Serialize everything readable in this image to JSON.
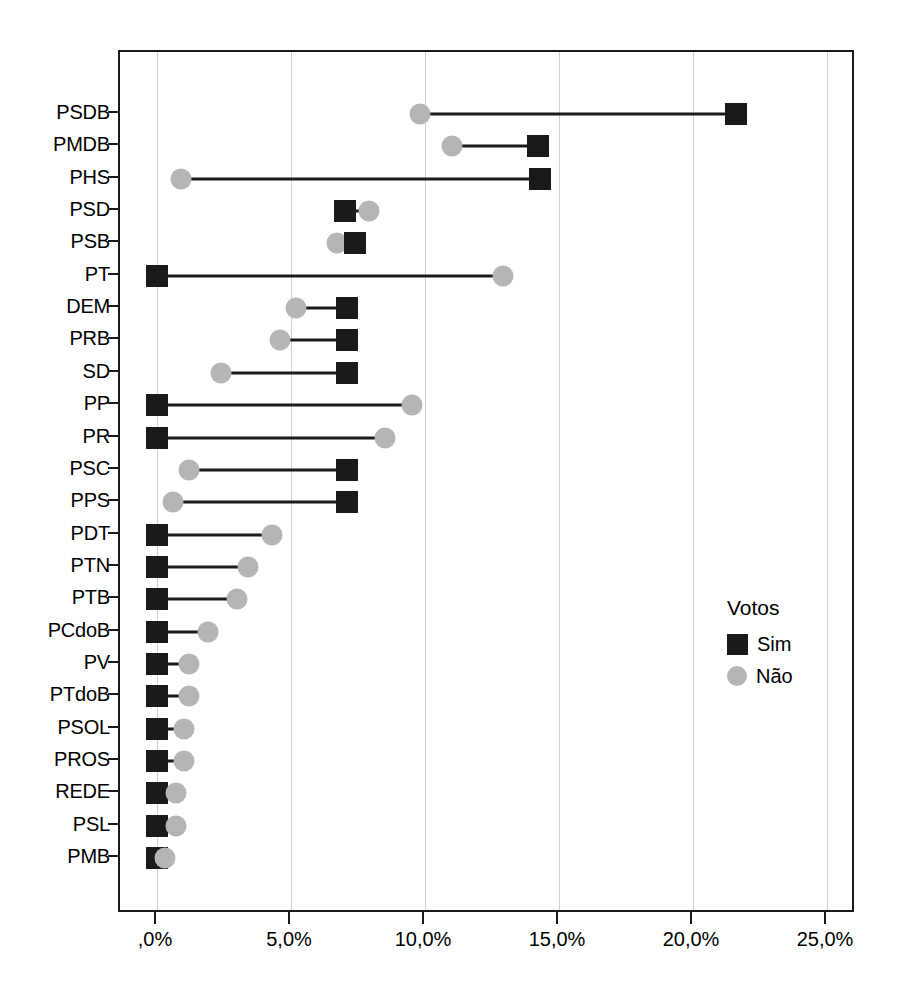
{
  "chart_data": {
    "type": "bar",
    "subtype": "dumbbell-lollipop",
    "title": "",
    "subtitle": "",
    "xlabel": "",
    "ylabel": "",
    "xlim": [
      -1.0,
      26.1
    ],
    "xticks": [
      0,
      5,
      10,
      15,
      20,
      25
    ],
    "xticklabels": [
      ",0%",
      "5,0%",
      "10,0%",
      "15,0%",
      "20,0%",
      "25,0%"
    ],
    "grid": "vertical",
    "legend": {
      "title": "Votos",
      "position": "right-inside",
      "entries": [
        {
          "label": "Sim",
          "marker": "square",
          "color": "#1a1a1a"
        },
        {
          "label": "Não",
          "marker": "circle",
          "color": "#b5b5b5"
        }
      ]
    },
    "categories": [
      "PSDB",
      "PMDB",
      "PHS",
      "PSD",
      "PSB",
      "PT",
      "DEM",
      "PRB",
      "SD",
      "PP",
      "PR",
      "PSC",
      "PPS",
      "PDT",
      "PTN",
      "PTB",
      "PCdoB",
      "PV",
      "PTdoB",
      "PSOL",
      "PROS",
      "REDE",
      "PSL",
      "PMB"
    ],
    "series": [
      {
        "name": "Sim",
        "values": [
          21.6,
          14.2,
          14.3,
          7.0,
          7.4,
          0.0,
          7.1,
          7.1,
          7.1,
          0.0,
          0.0,
          7.1,
          7.1,
          0.0,
          0.0,
          0.0,
          0.0,
          0.0,
          0.0,
          0.0,
          0.0,
          0.0,
          0.0,
          0.0
        ]
      },
      {
        "name": "Não",
        "values": [
          9.8,
          11.0,
          0.9,
          7.9,
          6.7,
          12.9,
          5.2,
          4.6,
          2.4,
          9.5,
          8.5,
          1.2,
          0.6,
          4.3,
          3.4,
          3.0,
          1.9,
          1.2,
          1.2,
          1.0,
          1.0,
          0.7,
          0.7,
          0.3
        ]
      }
    ]
  },
  "axis": {
    "y_categories": [
      "PSDB",
      "PMDB",
      "PHS",
      "PSD",
      "PSB",
      "PT",
      "DEM",
      "PRB",
      "SD",
      "PP",
      "PR",
      "PSC",
      "PPS",
      "PDT",
      "PTN",
      "PTB",
      "PCdoB",
      "PV",
      "PTdoB",
      "PSOL",
      "PROS",
      "REDE",
      "PSL",
      "PMB"
    ],
    "x_ticklabels": [
      ",0%",
      "5,0%",
      "10,0%",
      "15,0%",
      "20,0%",
      "25,0%"
    ]
  },
  "legend": {
    "title": "Votos",
    "sim_label": "Sim",
    "nao_label": "Não"
  },
  "colors": {
    "sim": "#1a1a1a",
    "nao": "#b5b5b5",
    "grid": "#cfcfcf",
    "frame": "#1a1a1a",
    "background": "#ffffff"
  }
}
